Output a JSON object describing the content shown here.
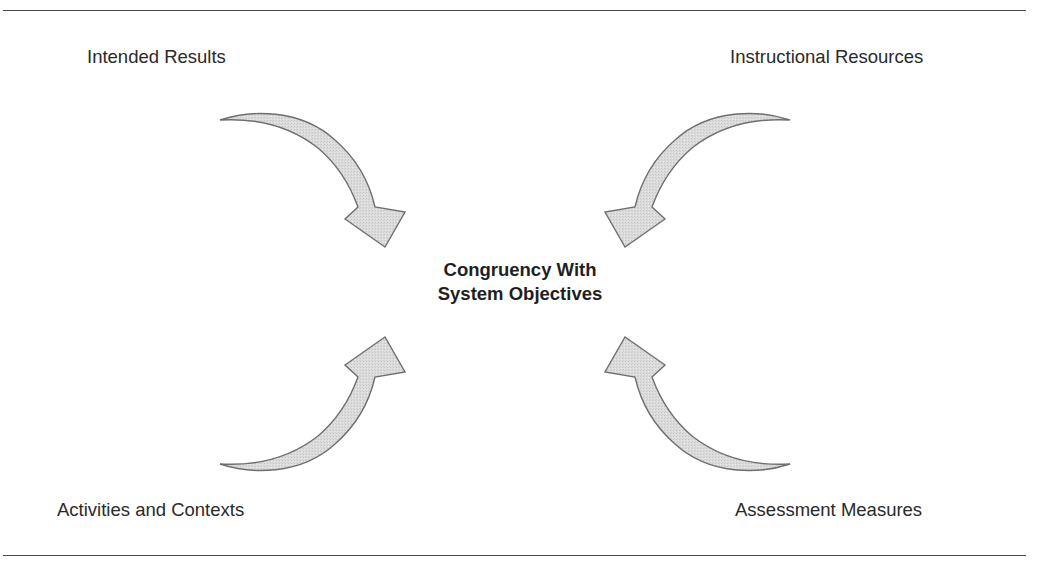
{
  "diagram": {
    "center": {
      "line1": "Congruency With",
      "line2": "System Objectives"
    },
    "nodes": [
      {
        "position": "top-left",
        "label": "Intended Results",
        "arrow_direction": "toward-center"
      },
      {
        "position": "top-right",
        "label": "Instructional Resources",
        "arrow_direction": "toward-center"
      },
      {
        "position": "bottom-left",
        "label": "Activities and Contexts",
        "arrow_direction": "toward-center"
      },
      {
        "position": "bottom-right",
        "label": "Assessment Measures",
        "arrow_direction": "toward-center"
      }
    ],
    "colors": {
      "arrow_fill": "#d9d9d9",
      "arrow_stroke": "#6f6f6f",
      "rule": "#4a4a4a",
      "text": "#2a2a2a"
    }
  }
}
